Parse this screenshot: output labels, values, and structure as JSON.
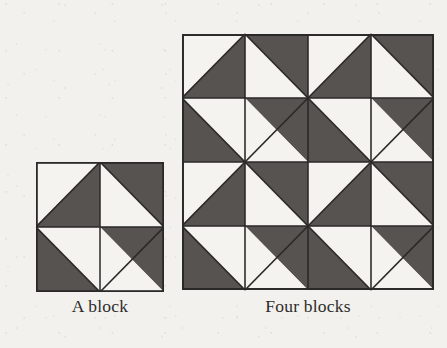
{
  "page": {
    "kind": "quilt-block-illustration",
    "background_color": "#f2f1ed",
    "ink_color": "#2e2c2a"
  },
  "palette": {
    "dark_patch": "#565350",
    "light_patch": "#f4f3ef",
    "seam_line": "#2b2927",
    "border_line": "#2b2927"
  },
  "figures": [
    {
      "id": "single-block",
      "caption": "A block",
      "grid_blocks": 1,
      "units_per_block": 2,
      "size_px": 128,
      "description": "One quilt block: four half-square-triangle units forming a dark diamond with white corners"
    },
    {
      "id": "four-blocks",
      "caption": "Four blocks",
      "grid_blocks": 4,
      "units_per_block": 2,
      "size_px": 252,
      "description": "Same block repeated in a two-by-two arrangement"
    }
  ],
  "block_pattern": {
    "name": "half-square-triangle pinwheel diamond",
    "units": [
      {
        "position": "top-left",
        "diagonal": "anti",
        "dark_half": "bottom-left"
      },
      {
        "position": "top-right",
        "diagonal": "main",
        "dark_half": "top-right"
      },
      {
        "position": "bottom-left",
        "diagonal": "main",
        "dark_half": "bottom-left"
      },
      {
        "position": "bottom-right",
        "diagonal": "anti",
        "dark_half": "top-right"
      }
    ]
  },
  "captions": {
    "single_block": "A block",
    "four_blocks": "Four blocks"
  }
}
